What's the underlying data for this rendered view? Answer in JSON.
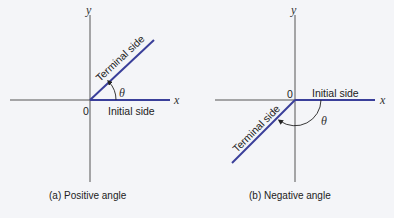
{
  "diagrams": [
    {
      "id": "a",
      "caption": "(a) Positive angle",
      "x_axis_label": "x",
      "y_axis_label": "y",
      "origin_label": "0",
      "angle_label": "θ",
      "initial_side_label": "Initial side",
      "terminal_side_label": "Terminal side"
    },
    {
      "id": "b",
      "caption": "(b) Negative angle",
      "x_axis_label": "x",
      "y_axis_label": "y",
      "origin_label": "0",
      "angle_label": "θ",
      "initial_side_label": "Initial side",
      "terminal_side_label": "Terminal side"
    }
  ],
  "colors": {
    "axis": "#555555",
    "ray": "#3a3f9a",
    "background": "#f4f5f8"
  }
}
